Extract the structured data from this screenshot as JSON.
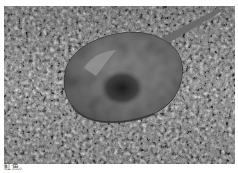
{
  "figure": {
    "image_alt": "Grayscale photograph of a stingray resting on a gravelly, speckled seabed",
    "caption": "魟魚。"
  }
}
